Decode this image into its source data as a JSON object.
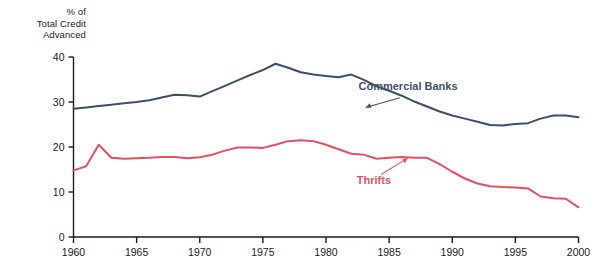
{
  "chart_data": {
    "type": "line",
    "title": "",
    "ylabel_lines": [
      "% of",
      "Total Credit",
      "Advanced"
    ],
    "xlabel": "",
    "xlim": [
      1960,
      2000
    ],
    "ylim": [
      0,
      40
    ],
    "xticks": [
      1960,
      1965,
      1970,
      1975,
      1980,
      1985,
      1990,
      1995,
      2000
    ],
    "yticks": [
      0,
      10,
      20,
      30,
      40
    ],
    "grid": false,
    "legend_position": "inline-annotations",
    "annotations": [
      {
        "text": "Commercial Banks",
        "color": "#3d4f6e",
        "x": 1986.5,
        "y": 32.6,
        "points_to": {
          "x": 1983.0,
          "y": 28.6
        }
      },
      {
        "text": "Thrifts",
        "color": "#e8505f",
        "x": 1983.8,
        "y": 11.8,
        "points_to": {
          "x": 1986.6,
          "y": 17.8
        }
      }
    ],
    "series": [
      {
        "name": "Commercial Banks",
        "color": "#3d4f6e",
        "x": [
          1960,
          1961,
          1962,
          1963,
          1964,
          1965,
          1966,
          1967,
          1968,
          1969,
          1970,
          1971,
          1972,
          1973,
          1974,
          1975,
          1976,
          1977,
          1978,
          1979,
          1980,
          1981,
          1982,
          1983,
          1984,
          1985,
          1986,
          1987,
          1988,
          1989,
          1990,
          1991,
          1992,
          1993,
          1994,
          1995,
          1996,
          1997,
          1998,
          1999,
          2000
        ],
        "values": [
          28.5,
          28.8,
          29.1,
          29.4,
          29.7,
          30.0,
          30.4,
          31.0,
          31.6,
          31.5,
          31.2,
          32.4,
          33.6,
          34.8,
          36.0,
          37.1,
          38.5,
          37.6,
          36.6,
          36.1,
          35.8,
          35.5,
          36.1,
          34.9,
          33.5,
          32.5,
          31.4,
          30.1,
          29.0,
          27.9,
          27.0,
          26.3,
          25.6,
          24.9,
          24.8,
          25.1,
          25.3,
          26.3,
          27.0,
          27.0,
          26.6
        ]
      },
      {
        "name": "Thrifts",
        "color": "#e8505f",
        "x": [
          1960,
          1961,
          1962,
          1963,
          1964,
          1965,
          1966,
          1967,
          1968,
          1969,
          1970,
          1971,
          1972,
          1973,
          1974,
          1975,
          1976,
          1977,
          1978,
          1979,
          1980,
          1981,
          1982,
          1983,
          1984,
          1985,
          1986,
          1987,
          1988,
          1989,
          1990,
          1991,
          1992,
          1993,
          1994,
          1995,
          1996,
          1997,
          1998,
          1999,
          2000
        ],
        "values": [
          14.8,
          15.7,
          20.5,
          17.6,
          17.4,
          17.5,
          17.6,
          17.8,
          17.8,
          17.5,
          17.7,
          18.3,
          19.2,
          19.9,
          19.9,
          19.8,
          20.5,
          21.3,
          21.5,
          21.3,
          20.5,
          19.5,
          18.5,
          18.3,
          17.4,
          17.6,
          17.8,
          17.6,
          17.6,
          16.2,
          14.5,
          13.0,
          11.9,
          11.3,
          11.1,
          11.0,
          10.8,
          9.0,
          8.6,
          8.5,
          6.6
        ]
      }
    ]
  }
}
